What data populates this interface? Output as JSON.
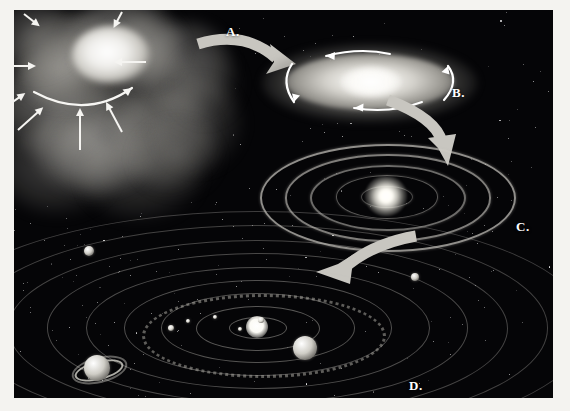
{
  "figure": {
    "background_color": "#050507",
    "page_color": "#f4f3f0",
    "arrow_color": "#c8c6c0",
    "label_color": "#ffffff"
  },
  "stages": [
    {
      "id": "A",
      "label": "A.",
      "name": "interstellar-nebula",
      "description": "Giant interstellar cloud of gas and dust collapsing under gravity",
      "label_x": 212,
      "label_y": 14
    },
    {
      "id": "B",
      "label": "B.",
      "name": "rotating-flattened-disk",
      "description": "Contracting cloud spins faster and flattens into a rotating disk",
      "label_x": 452,
      "label_y": 75
    },
    {
      "id": "C",
      "label": "C.",
      "name": "protoplanetary-rings",
      "description": "Disk separates into concentric rings around the forming protostar",
      "label_x": 516,
      "label_y": 219
    },
    {
      "id": "D",
      "label": "D.",
      "name": "solar-system",
      "description": "Rings accrete into planets orbiting the new star",
      "label_x": 409,
      "label_y": 378
    }
  ],
  "transitions": [
    {
      "from": "A",
      "to": "B",
      "name": "arrow-a-to-b"
    },
    {
      "from": "B",
      "to": "C",
      "name": "arrow-b-to-c"
    },
    {
      "from": "C",
      "to": "D",
      "name": "arrow-c-to-d"
    }
  ],
  "nebula": {
    "collapse_arrows": [
      {
        "x": 8,
        "y": 66,
        "len": 34,
        "angle": 0
      },
      {
        "x": 30,
        "y": 14,
        "len": 20,
        "angle": 38
      },
      {
        "x": 128,
        "y": 12,
        "len": 18,
        "angle": 118
      },
      {
        "x": 152,
        "y": 62,
        "len": 32,
        "angle": 180
      },
      {
        "x": 24,
        "y": 130,
        "len": 34,
        "angle": -42
      },
      {
        "x": 10,
        "y": 108,
        "len": 26,
        "angle": -35
      },
      {
        "x": 128,
        "y": 132,
        "len": 34,
        "angle": -118
      },
      {
        "x": 86,
        "y": 150,
        "len": 42,
        "angle": -90
      }
    ],
    "rotation_arrow": "curved-spin-arrow"
  },
  "disk_b": {
    "rotation_arrows": [
      "top-arc-arrow",
      "right-arc-arrow",
      "bottom-arc-arrow",
      "left-arc-arrow"
    ]
  },
  "rings_c": {
    "count": 5,
    "center_object": "protostar"
  },
  "system_d": {
    "orbit_count": 9,
    "star": "Sun",
    "asteroid_belt": true,
    "bodies": [
      {
        "name": "saturn",
        "label": "ringed planet",
        "x": 83,
        "y": 358,
        "r": 13,
        "rings": true
      },
      {
        "name": "jupiter",
        "label": "banded planet",
        "x": 291,
        "y": 338,
        "r": 12,
        "rings": false
      },
      {
        "name": "outer-planet-left",
        "label": "outer planet",
        "x": 75,
        "y": 241,
        "r": 5,
        "rings": false
      },
      {
        "name": "outer-planet-right",
        "label": "outer planet",
        "x": 401,
        "y": 267,
        "r": 4,
        "rings": false
      }
    ],
    "inner_planets": [
      {
        "name": "inner-planet-1",
        "x": 157,
        "y": 318,
        "r": 3
      },
      {
        "name": "inner-planet-2",
        "x": 174,
        "y": 311,
        "r": 2
      },
      {
        "name": "inner-planet-3",
        "x": 226,
        "y": 319,
        "r": 2
      },
      {
        "name": "inner-planet-4",
        "x": 247,
        "y": 310,
        "r": 3
      },
      {
        "name": "inner-planet-5",
        "x": 201,
        "y": 307,
        "r": 2
      }
    ]
  }
}
